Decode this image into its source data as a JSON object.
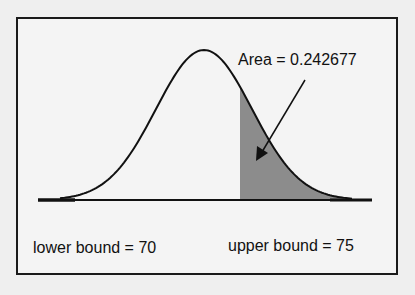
{
  "diagram": {
    "type": "normal-distribution-shaded-area",
    "area_label": "Area = 0.242677",
    "lower_bound_label": "lower bound = 70",
    "upper_bound_label": "upper bound = 75",
    "area_value": 0.242677,
    "lower_bound": 70,
    "upper_bound": 75,
    "colors": {
      "background": "#efefef",
      "frame": "#1a1a1a",
      "curve": "#111111",
      "shaded_region": "#8c8c8c"
    }
  }
}
